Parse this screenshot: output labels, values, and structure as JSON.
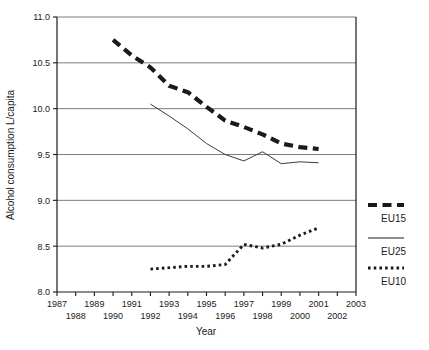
{
  "chart_data": {
    "type": "line",
    "title": "",
    "xlabel": "Year",
    "ylabel": "Alcohol consumption L/capita",
    "xlim": [
      1987,
      2003
    ],
    "ylim": [
      8.0,
      11.0
    ],
    "ytick_step": 0.5,
    "grid": true,
    "grid_axis": "y",
    "legend_position": "right",
    "xticks": [
      1987,
      1988,
      1989,
      1990,
      1991,
      1992,
      1993,
      1994,
      1995,
      1996,
      1997,
      1998,
      1999,
      2000,
      2001,
      2002,
      2003
    ],
    "xtick_labels_row1": [
      "1987",
      "1989",
      "1991",
      "1993",
      "1995",
      "1997",
      "1999",
      "2001",
      "2003"
    ],
    "xtick_labels_row2": [
      "1988",
      "1990",
      "1992",
      "1994",
      "1996",
      "1998",
      "2000",
      "2002"
    ],
    "yticks": [
      8.0,
      8.5,
      9.0,
      9.5,
      10.0,
      10.5,
      11.0
    ],
    "ytick_labels": [
      "8.0",
      "8.5",
      "9.0",
      "9.5",
      "10.0",
      "10.5",
      "11.0"
    ],
    "series": [
      {
        "name": "EU15",
        "style": "thick-dashed",
        "color": "#1a1a1a",
        "x": [
          1990,
          1991,
          1992,
          1993,
          1994,
          1995,
          1996,
          1997,
          1998,
          1999,
          2000,
          2001
        ],
        "values": [
          10.75,
          10.58,
          10.45,
          10.25,
          10.18,
          10.02,
          9.87,
          9.8,
          9.72,
          9.62,
          9.58,
          9.56
        ]
      },
      {
        "name": "EU25",
        "style": "thin-solid",
        "color": "#3a3a3a",
        "x": [
          1992,
          1993,
          1994,
          1995,
          1996,
          1997,
          1998,
          1999,
          2000,
          2001
        ],
        "values": [
          10.05,
          9.92,
          9.78,
          9.62,
          9.5,
          9.43,
          9.53,
          9.4,
          9.42,
          9.41
        ]
      },
      {
        "name": "EU10",
        "style": "dotted",
        "color": "#1a1a1a",
        "x": [
          1992,
          1994,
          1995,
          1996,
          1997,
          1998,
          1999,
          2000,
          2001
        ],
        "values": [
          8.25,
          8.28,
          8.28,
          8.3,
          8.52,
          8.48,
          8.52,
          8.62,
          8.7
        ]
      }
    ]
  },
  "legend": {
    "items": [
      {
        "label": "EU15",
        "style": "thick-dashed"
      },
      {
        "label": "EU25",
        "style": "thin-solid"
      },
      {
        "label": "EU10",
        "style": "dotted"
      }
    ]
  },
  "caption": {
    "text": ""
  }
}
